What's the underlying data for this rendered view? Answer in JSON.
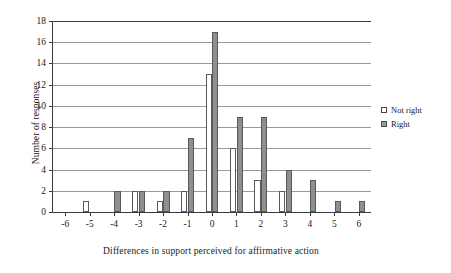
{
  "chart_data": {
    "type": "bar",
    "title": "",
    "xlabel": "Differences in support perceived for affirmative action",
    "ylabel": "Number of responses",
    "categories": [
      "-6",
      "-5",
      "-4",
      "-3",
      "-2",
      "-1",
      "0",
      "1",
      "2",
      "3",
      "4",
      "5",
      "6"
    ],
    "series": [
      {
        "name": "Not right",
        "color": "#ffffff",
        "values": [
          0,
          1,
          0,
          2,
          1,
          2,
          13,
          6,
          3,
          2,
          0,
          0,
          0
        ]
      },
      {
        "name": "Right",
        "color": "#8f8f8f",
        "values": [
          0,
          0,
          2,
          2,
          2,
          7,
          17,
          9,
          9,
          4,
          3,
          1,
          1
        ]
      }
    ],
    "ylim": [
      0,
      18
    ],
    "yticks": [
      0,
      2,
      4,
      6,
      8,
      10,
      12,
      14,
      16,
      18
    ],
    "ytick_labels": [
      "0",
      "2",
      "4",
      "6",
      "8",
      "10",
      "12",
      "14",
      "16",
      "18"
    ],
    "xtick_labels": [
      "-6",
      "-5",
      "-4",
      "-3",
      "-2",
      "-1",
      "0",
      "1",
      "2",
      "3",
      "4",
      "5",
      "6"
    ],
    "grid": true,
    "grid_axis": "y",
    "legend_position": "right",
    "legend": [
      "Not right",
      "Right"
    ]
  }
}
